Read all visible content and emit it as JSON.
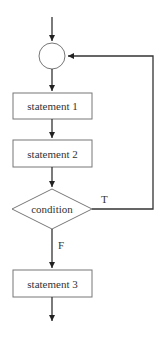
{
  "diagram": {
    "type": "flowchart",
    "nodes": [
      {
        "id": "junction",
        "shape": "circle",
        "label": ""
      },
      {
        "id": "s1",
        "shape": "rect",
        "label": "statement 1"
      },
      {
        "id": "s2",
        "shape": "rect",
        "label": "statement 2"
      },
      {
        "id": "cond",
        "shape": "diamond",
        "label": "condition"
      },
      {
        "id": "s3",
        "shape": "rect",
        "label": "statement 3"
      }
    ],
    "edges": [
      {
        "from": "entry",
        "to": "junction",
        "label": ""
      },
      {
        "from": "junction",
        "to": "s1",
        "label": ""
      },
      {
        "from": "s1",
        "to": "s2",
        "label": ""
      },
      {
        "from": "s2",
        "to": "cond",
        "label": ""
      },
      {
        "from": "cond",
        "to": "junction",
        "label": "T"
      },
      {
        "from": "cond",
        "to": "s3",
        "label": "F"
      },
      {
        "from": "s3",
        "to": "exit",
        "label": ""
      }
    ],
    "labels": {
      "statement1": "statement 1",
      "statement2": "statement 2",
      "condition": "condition",
      "statement3": "statement 3",
      "true_branch": "T",
      "false_branch": "F"
    }
  }
}
